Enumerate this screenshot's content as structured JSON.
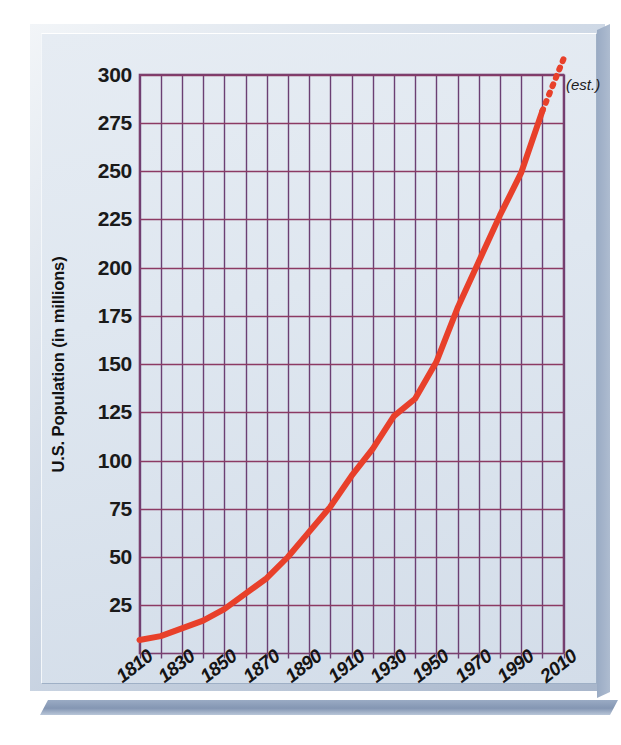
{
  "chart_data": {
    "type": "line",
    "title": "",
    "xlabel": "",
    "ylabel": "U.S. Population (in millions)",
    "xlim": [
      1810,
      2010
    ],
    "ylim": [
      0,
      300
    ],
    "grid": true,
    "legend": null,
    "y_ticks": [
      300,
      275,
      250,
      225,
      200,
      175,
      150,
      125,
      100,
      75,
      50,
      25
    ],
    "x_ticks": [
      "1810",
      "1830",
      "1850",
      "1870",
      "1890",
      "1910",
      "1930",
      "1950",
      "1970",
      "1990",
      "2010"
    ],
    "x_gridline_years": [
      1810,
      1820,
      1830,
      1840,
      1850,
      1860,
      1870,
      1880,
      1890,
      1900,
      1910,
      1920,
      1930,
      1940,
      1950,
      1960,
      1970,
      1980,
      1990,
      2000,
      2010
    ],
    "annotations": [
      {
        "text": "(est.)",
        "x": 2010,
        "y": 300,
        "style": "italic"
      }
    ],
    "series": [
      {
        "name": "U.S. Population",
        "color": "#e8402a",
        "x": [
          1810,
          1820,
          1830,
          1840,
          1850,
          1860,
          1870,
          1880,
          1890,
          1900,
          1910,
          1920,
          1930,
          1940,
          1950,
          1960,
          1970,
          1980,
          1990,
          2000
        ],
        "values": [
          7,
          9,
          13,
          17,
          23,
          31,
          39,
          50,
          63,
          76,
          92,
          106,
          123,
          132,
          151,
          179,
          203,
          227,
          249,
          281
        ],
        "solid_until": 2000
      },
      {
        "name": "U.S. Population (estimated)",
        "color": "#e8402a",
        "dashed": true,
        "x": [
          2000,
          2010
        ],
        "values": [
          281,
          308
        ]
      }
    ]
  },
  "figure": {
    "panel_bg": "#dfe7f0",
    "frame_color": "#9fb0c6",
    "grid_color": "#7b3f6e",
    "line_color": "#e8402a",
    "tick_text_color": "#1a1a1a"
  }
}
